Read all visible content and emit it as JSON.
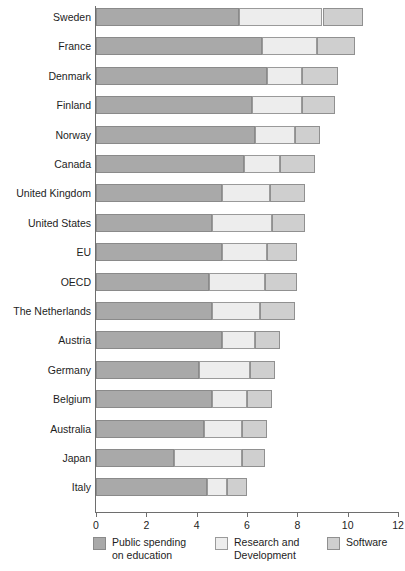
{
  "chart_data": {
    "type": "bar",
    "orientation": "horizontal",
    "stacked": true,
    "title": "",
    "subtitle": "",
    "xlabel": "",
    "ylabel": "",
    "xlim": [
      0,
      12
    ],
    "xticks": [
      0,
      2,
      4,
      6,
      8,
      10,
      12
    ],
    "xtick_labels": [
      "0",
      "2",
      "4",
      "6",
      "8",
      "10",
      "12"
    ],
    "grid": false,
    "legend_position": "bottom",
    "categories": [
      "Sweden",
      "France",
      "Denmark",
      "Finland",
      "Norway",
      "Canada",
      "United Kingdom",
      "United States",
      "EU",
      "OECD",
      "The Netherlands",
      "Austria",
      "Germany",
      "Belgium",
      "Australia",
      "Japan",
      "Italy"
    ],
    "series": [
      {
        "name": "Public spending\non education",
        "color": "#a9a9a9",
        "values": [
          5.7,
          6.6,
          6.8,
          6.2,
          6.3,
          5.9,
          5.0,
          4.6,
          5.0,
          4.5,
          4.6,
          5.0,
          4.1,
          4.6,
          4.3,
          3.1,
          4.4
        ]
      },
      {
        "name": "Research and\nDevelopment",
        "color": "#ededed",
        "values": [
          3.3,
          2.2,
          1.4,
          2.0,
          1.6,
          1.4,
          1.9,
          2.4,
          1.8,
          2.2,
          1.9,
          1.3,
          2.0,
          1.4,
          1.5,
          2.7,
          0.8
        ]
      },
      {
        "name": "Software",
        "color": "#cfcfcf",
        "values": [
          1.6,
          1.5,
          1.4,
          1.3,
          1.0,
          1.4,
          1.4,
          1.3,
          1.2,
          1.3,
          1.4,
          1.0,
          1.0,
          1.0,
          1.0,
          0.9,
          0.8
        ]
      }
    ],
    "totals": [
      10.6,
      10.3,
      9.6,
      9.5,
      8.9,
      8.7,
      8.3,
      8.3,
      8.0,
      8.0,
      7.9,
      7.3,
      7.1,
      7.0,
      6.8,
      6.7,
      6.0
    ]
  },
  "legend": {
    "items": [
      {
        "label": "Public spending\non education",
        "swatch": "s0"
      },
      {
        "label": "Research and\nDevelopment",
        "swatch": "s1"
      },
      {
        "label": "Software",
        "swatch": "s2"
      }
    ]
  }
}
